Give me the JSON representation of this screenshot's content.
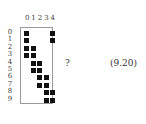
{
  "figure": {
    "column_labels": [
      "0",
      "1",
      "2",
      "3",
      "4"
    ],
    "row_labels": [
      "0",
      "1",
      "2",
      "3",
      "4",
      "5",
      "6",
      "7",
      "8",
      "9"
    ],
    "filled_cells": [
      [
        0,
        0
      ],
      [
        0,
        4
      ],
      [
        1,
        0
      ],
      [
        1,
        4
      ],
      [
        2,
        0
      ],
      [
        2,
        1
      ],
      [
        3,
        0
      ],
      [
        3,
        1
      ],
      [
        4,
        1
      ],
      [
        4,
        2
      ],
      [
        5,
        1
      ],
      [
        5,
        2
      ],
      [
        6,
        2
      ],
      [
        6,
        3
      ],
      [
        7,
        2
      ],
      [
        7,
        3
      ],
      [
        8,
        3
      ],
      [
        8,
        4
      ],
      [
        9,
        3
      ],
      [
        9,
        4
      ]
    ],
    "question_mark": "?",
    "equation_number": "(9.20)"
  }
}
